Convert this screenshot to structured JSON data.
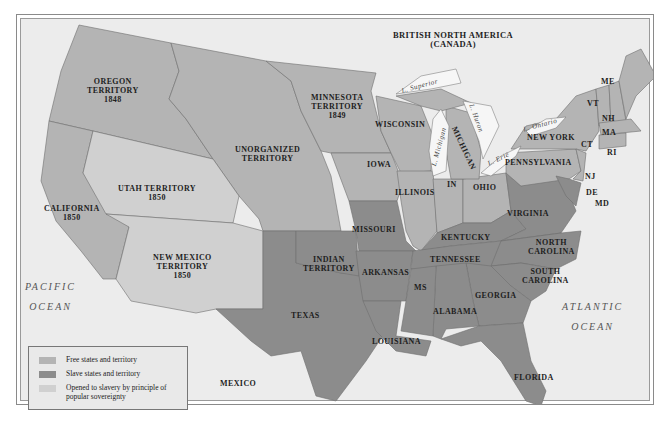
{
  "colors": {
    "free": "#b4b4b4",
    "slave": "#8c8c8c",
    "popular_sovereignty": "#d0d0d0",
    "water": "#ececec",
    "lake": "#f6f6f6",
    "border": "#6e6e6e"
  },
  "regions": {
    "british_north_america": "BRITISH NORTH AMERICA\n(CANADA)",
    "oregon": "OREGON\nTERRITORY\n1848",
    "minnesota": "MINNESOTA\nTERRITORY\n1849",
    "unorganized": "UNORGANIZED\nTERRITORY",
    "utah": "UTAH TERRITORY\n1850",
    "california": "CALIFORNIA\n1850",
    "new_mexico": "NEW MEXICO\nTERRITORY\n1850",
    "wisconsin": "WISCONSIN",
    "michigan": "MICHIGAN",
    "iowa": "IOWA",
    "illinois": "ILLINOIS",
    "indiana": "IN",
    "ohio": "OHIO",
    "pennsylvania": "PENNSYLVANIA",
    "new_york": "NEW YORK",
    "maine": "ME",
    "vermont": "VT",
    "new_hampshire": "NH",
    "massachusetts": "MA",
    "connecticut": "CT",
    "rhode_island": "RI",
    "new_jersey": "NJ",
    "delaware": "DE",
    "maryland": "MD",
    "missouri": "MISSOURI",
    "kentucky": "KENTUCKY",
    "virginia": "VIRGINIA",
    "north_carolina": "NORTH\nCAROLINA",
    "tennessee": "TENNESSEE",
    "indian_territory": "INDIAN\nTERRITORY",
    "arkansas": "ARKANSAS",
    "south_carolina": "SOUTH\nCAROLINA",
    "mississippi": "MS",
    "georgia": "GEORGIA",
    "alabama": "ALABAMA",
    "texas": "TEXAS",
    "louisiana": "LOUISIANA",
    "florida": "FLORIDA",
    "mexico": "MEXICO"
  },
  "oceans": {
    "pacific": "PACIFIC\nOCEAN",
    "atlantic": "ATLANTIC\nOCEAN"
  },
  "lakes": {
    "superior": "L. Superior",
    "michigan": "L. Michigan",
    "huron": "L. Huron",
    "erie": "L. Erie",
    "ontario": "L. Ontario"
  },
  "legend": {
    "items": [
      {
        "label": "Free states and territory",
        "color": "#b4b4b4"
      },
      {
        "label": "Slave states and territory",
        "color": "#8c8c8c"
      },
      {
        "label": "Opened to slavery by principle of\npopular sovereignty",
        "color": "#d0d0d0"
      }
    ]
  }
}
